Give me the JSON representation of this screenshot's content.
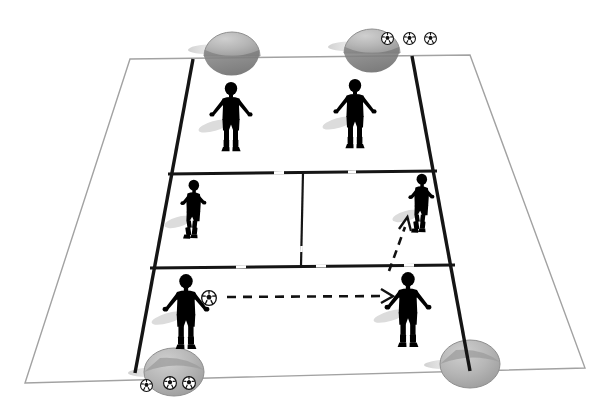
{
  "diagram": {
    "sport": "soccer",
    "view": "perspective-pitch",
    "background_color": "#ffffff",
    "line_color_outer": "#9a9a9a",
    "line_color_inner": "#1a1a1a",
    "arc_color": "#e8e8e8",
    "cone_color": "#b4b4b4",
    "cone_shade_color": "#8d8d8d",
    "shadow_color": "#cfcfcf"
  },
  "field": {
    "name": "training-grid",
    "outer_polygon": [
      [
        130,
        59
      ],
      [
        470,
        55
      ],
      [
        585,
        368
      ],
      [
        25,
        383
      ]
    ],
    "inner_left_line": [
      [
        193,
        59
      ],
      [
        135,
        373
      ]
    ],
    "inner_right_line": [
      [
        412,
        56
      ],
      [
        470,
        371
      ]
    ],
    "band_divider_top": [
      [
        168,
        174
      ],
      [
        437,
        171
      ]
    ],
    "band_divider_bottom": [
      [
        150,
        268
      ],
      [
        455,
        265
      ]
    ],
    "middle_vertical_divider": [
      [
        303,
        172
      ],
      [
        301,
        266
      ]
    ],
    "zones": [
      {
        "name": "attacking-third",
        "label": "top band"
      },
      {
        "name": "middle-third",
        "label": "middle band split in two"
      },
      {
        "name": "defending-third",
        "label": "bottom band"
      }
    ],
    "arcs": [
      {
        "name": "ghost-circle-left",
        "cx": 180,
        "cy": 200,
        "r": 130
      },
      {
        "name": "ghost-circle-right",
        "cx": 420,
        "cy": 200,
        "r": 130
      }
    ]
  },
  "cones": [
    {
      "name": "cone-top-left",
      "x": 232,
      "y": 45,
      "rx": 28,
      "ry": 22
    },
    {
      "name": "cone-top-right",
      "x": 372,
      "y": 42,
      "rx": 28,
      "ry": 22
    },
    {
      "name": "cone-bottom-left",
      "x": 174,
      "y": 372,
      "rx": 30,
      "ry": 24
    },
    {
      "name": "cone-bottom-right",
      "x": 470,
      "y": 364,
      "rx": 30,
      "ry": 24
    }
  ],
  "balls": [
    {
      "name": "ball-top-1",
      "x": 387,
      "y": 38,
      "r": 6
    },
    {
      "name": "ball-top-2",
      "x": 409,
      "y": 38,
      "r": 6
    },
    {
      "name": "ball-top-3",
      "x": 430,
      "y": 38,
      "r": 6
    },
    {
      "name": "ball-bottom-1",
      "x": 146,
      "y": 385,
      "r": 6
    },
    {
      "name": "ball-bottom-2",
      "x": 170,
      "y": 382,
      "r": 6
    },
    {
      "name": "ball-bottom-3",
      "x": 189,
      "y": 382,
      "r": 6
    },
    {
      "name": "ball-at-player-bottom-left",
      "x": 209,
      "y": 298,
      "r": 7
    }
  ],
  "players": [
    {
      "name": "player-white-top-left",
      "x": 231,
      "y": 108,
      "kit": "white",
      "pose": "standing-arms-out",
      "scale": 1.0
    },
    {
      "name": "player-white-top-right",
      "x": 355,
      "y": 105,
      "kit": "white",
      "pose": "standing-arms-out",
      "scale": 1.0
    },
    {
      "name": "player-grey-mid-left",
      "x": 192,
      "y": 205,
      "kit": "grey",
      "pose": "running-right",
      "scale": 0.88
    },
    {
      "name": "player-grey-mid-right",
      "x": 420,
      "y": 200,
      "kit": "grey",
      "pose": "running-right",
      "scale": 0.88
    },
    {
      "name": "player-dark-bottom-left",
      "x": 186,
      "y": 302,
      "kit": "dark",
      "pose": "standing-arms-out",
      "scale": 1.05
    },
    {
      "name": "player-dark-bottom-right",
      "x": 408,
      "y": 300,
      "kit": "dark",
      "pose": "standing-arms-out",
      "scale": 1.05
    }
  ],
  "arrows": [
    {
      "name": "pass-arrow-horizontal",
      "type": "dashed-pass",
      "from": [
        227,
        297
      ],
      "to": [
        391,
        296
      ],
      "description": "pass from bottom-left dark player to bottom-right dark player"
    },
    {
      "name": "run-arrow-diagonal",
      "type": "dashed-run",
      "from": [
        389,
        271
      ],
      "to": [
        409,
        216
      ],
      "description": "run from bottom-right area up to middle-right player"
    }
  ],
  "legend": {
    "white_kit_label": "Attacking players",
    "grey_kit_label": "Midfield players",
    "dark_kit_label": "Passing pair",
    "dashed_arrow_label": "Pass / movement"
  }
}
